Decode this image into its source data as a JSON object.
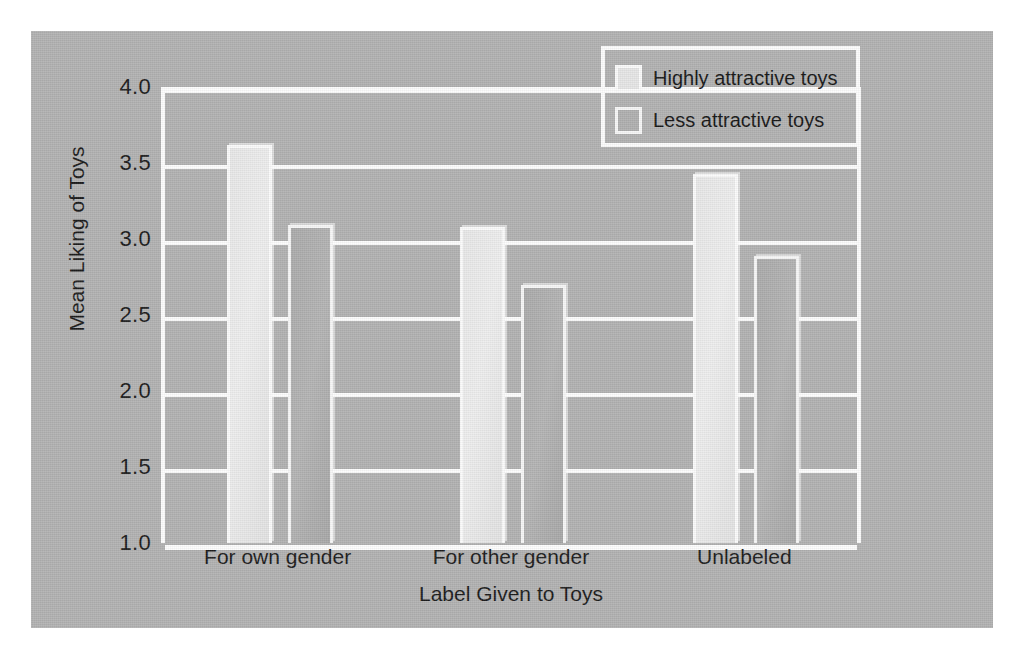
{
  "chart_data": {
    "type": "bar",
    "title": "",
    "xlabel": "Label Given to Toys",
    "ylabel": "Mean Liking of Toys",
    "categories": [
      "For own gender",
      "For other gender",
      "Unlabeled"
    ],
    "series": [
      {
        "name": "Highly attractive toys",
        "values": [
          3.62,
          3.08,
          3.43
        ]
      },
      {
        "name": "Less attractive toys",
        "values": [
          3.09,
          2.7,
          2.89
        ]
      }
    ],
    "ylim": [
      1.0,
      4.0
    ],
    "yticks": [
      "1.0",
      "1.5",
      "2.0",
      "2.5",
      "3.0",
      "3.5",
      "4.0"
    ],
    "ytick_values": [
      1.0,
      1.5,
      2.0,
      2.5,
      3.0,
      3.5,
      4.0
    ],
    "grid": "horizontal",
    "legend_position": "top-right",
    "colors": {
      "panel_background": "#b2b2b2",
      "outer_background": "#ffffff",
      "gridline": "#fdfdfd",
      "series_0_fill": "#e8e8e8",
      "series_1_fill": "#ababab",
      "bar_border": "#fbfbfb",
      "text": "#1b1b1b"
    }
  },
  "legend": {
    "items": [
      {
        "label": "Highly attractive toys"
      },
      {
        "label": "Less attractive toys"
      }
    ]
  }
}
